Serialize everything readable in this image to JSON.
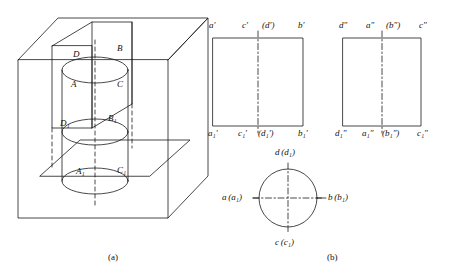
{
  "figure": {
    "captions": [
      {
        "text": "(a)",
        "x": 117,
        "y": 258
      },
      {
        "text": "(b)",
        "x": 333,
        "y": 258
      }
    ]
  },
  "pictorial": {
    "name": "axonometric-cylinder-in-trihedral",
    "labels": [
      {
        "text": "D",
        "x": 73,
        "y": 54
      },
      {
        "text": "B",
        "x": 117,
        "y": 48
      },
      {
        "text": "A",
        "x": 71,
        "y": 84
      },
      {
        "text": "C",
        "x": 117,
        "y": 84
      },
      {
        "text": "D₁",
        "x": 62,
        "y": 123
      },
      {
        "text": "B₁",
        "x": 110,
        "y": 118
      },
      {
        "text": "A₁",
        "x": 78,
        "y": 171
      },
      {
        "text": "C₁",
        "x": 119,
        "y": 170
      }
    ]
  },
  "projections": {
    "front_view": {
      "name": "front-view",
      "top_labels": [
        {
          "text": "a′",
          "x": 209,
          "y": 27
        },
        {
          "text": "c′",
          "x": 242,
          "y": 27
        },
        {
          "text": "(d′)",
          "x": 266,
          "y": 27
        },
        {
          "text": "b′",
          "x": 300,
          "y": 27
        }
      ],
      "bottom_labels": [
        {
          "text": "a₁′",
          "x": 209,
          "y": 133
        },
        {
          "text": "c₁′",
          "x": 240,
          "y": 133
        },
        {
          "text": "(d₁′)",
          "x": 262,
          "y": 133
        },
        {
          "text": "b₁′",
          "x": 300,
          "y": 133
        }
      ]
    },
    "side_view": {
      "name": "side-view",
      "top_labels": [
        {
          "text": "d″",
          "x": 339,
          "y": 27
        },
        {
          "text": "a″",
          "x": 368,
          "y": 27
        },
        {
          "text": "(b″)",
          "x": 390,
          "y": 27
        },
        {
          "text": "c″",
          "x": 422,
          "y": 27
        }
      ],
      "bottom_labels": [
        {
          "text": "d₁″",
          "x": 336,
          "y": 133
        },
        {
          "text": "a₁″",
          "x": 364,
          "y": 133
        },
        {
          "text": "(b₁″)",
          "x": 386,
          "y": 133
        },
        {
          "text": "c₁″",
          "x": 420,
          "y": 133
        }
      ]
    },
    "top_view": {
      "name": "top-view",
      "labels": [
        {
          "text": "d (d₁)",
          "x": 290,
          "y": 153
        },
        {
          "text": "a (a₁)",
          "x": 244,
          "y": 198
        },
        {
          "text": "b (b₁)",
          "x": 330,
          "y": 198
        },
        {
          "text": "c (c₁)",
          "x": 288,
          "y": 243
        }
      ]
    }
  },
  "colors": {
    "stroke": "#1a1a1a",
    "background": "#ffffff"
  }
}
